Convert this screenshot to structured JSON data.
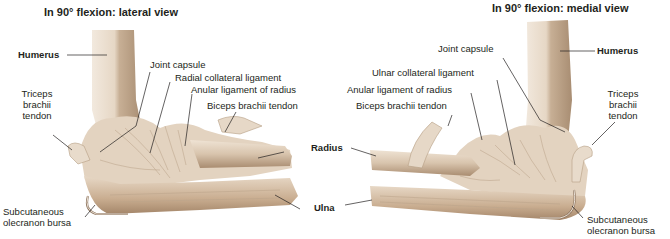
{
  "figure": {
    "colors": {
      "background": "#ffffff",
      "bone_light": "#efe4d6",
      "bone_mid": "#d9c6b0",
      "bone_dark": "#b89e84",
      "ligament": "#e8dccd",
      "leader_line": "#231f20",
      "text": "#231f20"
    },
    "left_panel": {
      "title": "In 90° flexion: lateral view",
      "labels": {
        "humerus": "Humerus",
        "joint_capsule": "Joint capsule",
        "radial_collateral_ligament": "Radial collateral ligament",
        "anular_ligament": "Anular ligament of radius",
        "biceps_tendon": "Biceps brachii tendon",
        "triceps_line1": "Triceps",
        "triceps_line2": "brachii",
        "triceps_line3": "tendon",
        "bursa_line1": "Subcutaneous",
        "bursa_line2": "olecranon bursa"
      }
    },
    "right_panel": {
      "title": "In 90° flexion: medial view",
      "labels": {
        "humerus": "Humerus",
        "joint_capsule": "Joint capsule",
        "ulnar_collateral_ligament": "Ulnar collateral ligament",
        "anular_ligament": "Anular ligament of radius",
        "biceps_tendon": "Biceps brachii tendon",
        "triceps_line1": "Triceps",
        "triceps_line2": "brachii",
        "triceps_line3": "tendon",
        "bursa_line1": "Subcutaneous",
        "bursa_line2": "olecranon bursa"
      }
    },
    "shared_labels": {
      "radius": "Radius",
      "ulna": "Ulna"
    }
  }
}
